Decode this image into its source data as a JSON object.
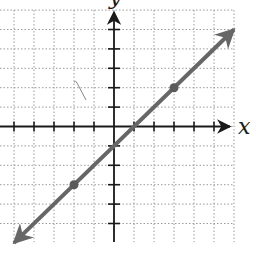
{
  "chart_data": {
    "type": "line",
    "title": "",
    "xlabel": "x",
    "ylabel": "y",
    "xlim": [
      -5.5,
      6
    ],
    "ylim": [
      -6,
      6
    ],
    "grid": true,
    "grid_style": "dotted",
    "x_ticks": [
      -5,
      -4,
      -3,
      -2,
      -1,
      1,
      2,
      3,
      4,
      5
    ],
    "y_ticks": [
      -5,
      -4,
      -3,
      -2,
      -1,
      1,
      2,
      3,
      4,
      5
    ],
    "series": [
      {
        "name": "y = x - 1",
        "equation": "y = x - 1",
        "slope": 1,
        "intercept": -1,
        "extends_both_ways": true,
        "color": "#666666",
        "points": [
          {
            "x": -2,
            "y": -3
          },
          {
            "x": 3,
            "y": 2
          }
        ]
      }
    ]
  },
  "labels": {
    "x_axis": "x",
    "y_axis": "y"
  },
  "colors": {
    "axis": "#1a1a1a",
    "grid": "#9a9a9a",
    "line": "#666666",
    "point": "#5a5a5a"
  }
}
